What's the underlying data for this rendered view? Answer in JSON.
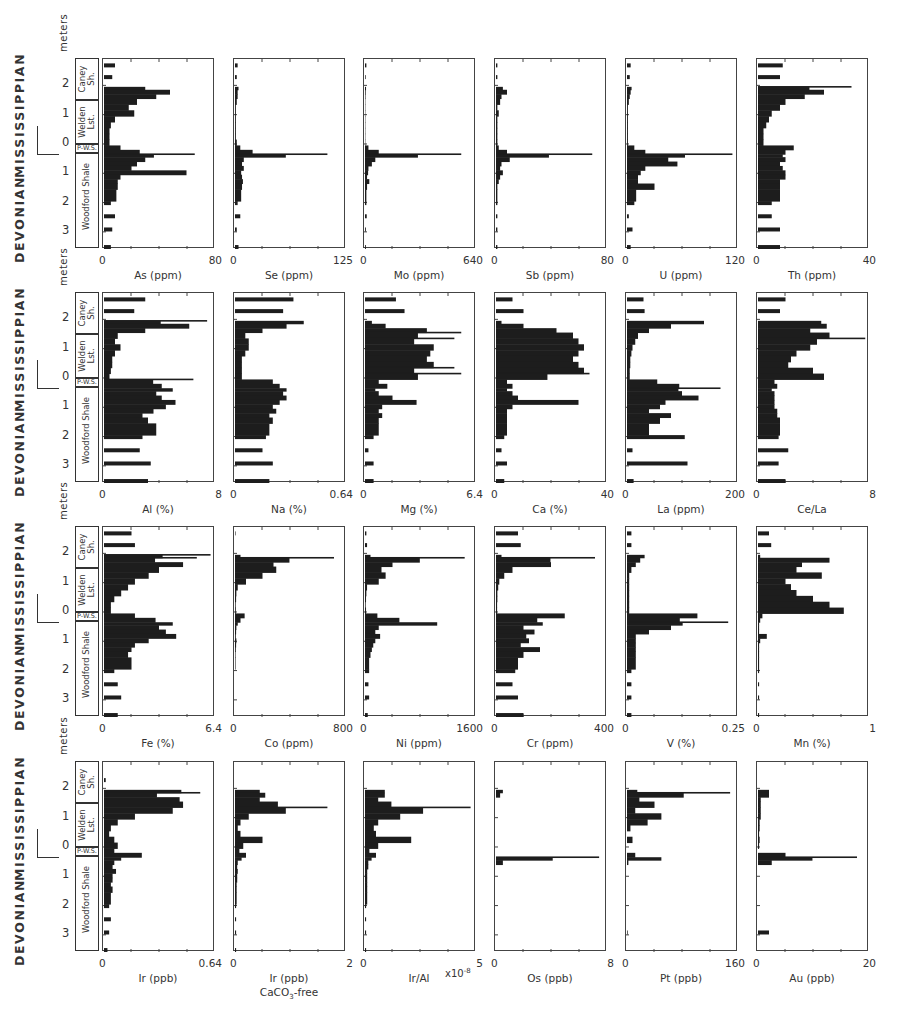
{
  "figure": {
    "stratigraphy": {
      "eras": [
        "MISSISSIPPIAN",
        "DEVONIAN"
      ],
      "depth_axis_label": "meters",
      "depth_ticks": [
        "2",
        "1",
        "0",
        "1",
        "2",
        "3"
      ],
      "units": [
        {
          "name": "Caney Sh.",
          "line1": "Caney",
          "line2": "Sh."
        },
        {
          "name": "Welden Lst.",
          "line1": "Welden",
          "line2": "Lst."
        },
        {
          "name": "P-W.S.",
          "line1": "P-W.S.",
          "line2": ""
        },
        {
          "name": "Woodford Shale",
          "line1": "Woodford Shale",
          "line2": ""
        }
      ],
      "sublabel_mark": "p"
    },
    "rows": [
      {
        "panels": [
          {
            "label": "As (ppm)",
            "min": "0",
            "max": "80"
          },
          {
            "label": "Se (ppm)",
            "min": "0",
            "max": "125"
          },
          {
            "label": "Mo (ppm)",
            "min": "0",
            "max": "640"
          },
          {
            "label": "Sb (ppm)",
            "min": "0",
            "max": "80"
          },
          {
            "label": "U (ppm)",
            "min": "0",
            "max": "120"
          },
          {
            "label": "Th (ppm)",
            "min": "0",
            "max": "40"
          }
        ]
      },
      {
        "panels": [
          {
            "label": "Al (%)",
            "min": "0",
            "max": "8"
          },
          {
            "label": "Na (%)",
            "min": "0",
            "max": "0.64"
          },
          {
            "label": "Mg (%)",
            "min": "0",
            "max": "6.4"
          },
          {
            "label": "Ca (%)",
            "min": "0",
            "max": "40"
          },
          {
            "label": "La (ppm)",
            "min": "0",
            "max": "200"
          },
          {
            "label": "Ce/La",
            "min": "0",
            "max": "8"
          }
        ]
      },
      {
        "panels": [
          {
            "label": "Fe (%)",
            "min": "0",
            "max": "6.4"
          },
          {
            "label": "Co (ppm)",
            "min": "0",
            "max": "800"
          },
          {
            "label": "Ni (ppm)",
            "min": "0",
            "max": "1600"
          },
          {
            "label": "Cr (ppm)",
            "min": "0",
            "max": "400"
          },
          {
            "label": "V (%)",
            "min": "0",
            "max": "0.25"
          },
          {
            "label": "Mn (%)",
            "min": "0",
            "max": "1"
          }
        ]
      },
      {
        "panels": [
          {
            "label": "Ir (ppb)",
            "min": "0",
            "max": "0.64"
          },
          {
            "label": "Ir (ppb)",
            "sub": "CaCO3-free",
            "min": "0",
            "max": "2"
          },
          {
            "label": "Ir/Al",
            "suffix": "x10^-8",
            "min": "0",
            "max": "5"
          },
          {
            "label": "Os (ppb)",
            "min": "0",
            "max": "8"
          },
          {
            "label": "Pt (ppb)",
            "min": "0",
            "max": "160"
          },
          {
            "label": "Au (ppb)",
            "min": "0",
            "max": "20"
          }
        ]
      }
    ]
  },
  "chart_data": {
    "type": "bar",
    "orientation": "horizontal",
    "title": "",
    "ylabel": "meters (depth relative to Devonian-Mississippian boundary; positive up above 0, positive down below 0)",
    "ylim": [
      -2.9,
      3.6
    ],
    "y_ticks": [
      2,
      1,
      0,
      -1,
      -2,
      -3
    ],
    "grid": false,
    "legend": null,
    "units_stratigraphic": [
      {
        "unit": "Caney Sh.",
        "from_m": 2.9,
        "to_m": 1.45
      },
      {
        "unit": "Welden Lst.",
        "from_m": 1.45,
        "to_m": -0.05
      },
      {
        "unit": "P-W.S.",
        "from_m": -0.05,
        "to_m": -0.35
      },
      {
        "unit": "Woodford Shale",
        "from_m": -0.35,
        "to_m": -3.6
      }
    ],
    "depth_samples_m": [
      2.75,
      2.35,
      1.95,
      1.85,
      1.7,
      1.55,
      1.35,
      1.15,
      0.95,
      0.75,
      0.55,
      0.35,
      0.15,
      -0.05,
      -0.2,
      -0.35,
      -0.45,
      -0.6,
      -0.75,
      -0.9,
      -1.05,
      -1.2,
      -1.35,
      -1.55,
      -1.95,
      -2.4,
      -2.85,
      -3.45
    ],
    "panels": [
      {
        "name": "As",
        "unit": "ppm",
        "xlim": [
          0,
          80
        ],
        "values": [
          8,
          6,
          30,
          48,
          38,
          24,
          18,
          22,
          8,
          5,
          4,
          4,
          4,
          12,
          26,
          66,
          30,
          24,
          20,
          60,
          12,
          10,
          10,
          9,
          5,
          8,
          6,
          5
        ]
      },
      {
        "name": "Se",
        "unit": "ppm",
        "xlim": [
          0,
          125
        ],
        "values": [
          3,
          2,
          4,
          3,
          3,
          2,
          1,
          1,
          1,
          1,
          1,
          1,
          2,
          6,
          20,
          105,
          10,
          8,
          10,
          7,
          8,
          9,
          8,
          7,
          3,
          6,
          2,
          4
        ]
      },
      {
        "name": "Mo",
        "unit": "ppm",
        "xlim": [
          0,
          640
        ],
        "values": [
          8,
          4,
          6,
          4,
          3,
          2,
          2,
          2,
          2,
          2,
          2,
          2,
          2,
          20,
          80,
          560,
          60,
          40,
          20,
          18,
          12,
          25,
          12,
          8,
          8,
          10,
          5,
          5
        ]
      },
      {
        "name": "Sb",
        "unit": "ppm",
        "xlim": [
          0,
          80
        ],
        "values": [
          1,
          1,
          5,
          8,
          4,
          3,
          1,
          2,
          1,
          1,
          1,
          1,
          1,
          2,
          8,
          70,
          10,
          4,
          3,
          5,
          3,
          2,
          1,
          1,
          1,
          1,
          1,
          1
        ]
      },
      {
        "name": "U",
        "unit": "ppm",
        "xlim": [
          0,
          120
        ],
        "values": [
          4,
          3,
          5,
          4,
          3,
          2,
          1,
          1,
          1,
          1,
          1,
          1,
          1,
          8,
          20,
          115,
          45,
          55,
          20,
          15,
          12,
          12,
          30,
          10,
          8,
          2,
          6,
          4
        ]
      },
      {
        "name": "Th",
        "unit": "ppm",
        "xlim": [
          0,
          40
        ],
        "values": [
          9,
          8,
          34,
          24,
          17,
          10,
          8,
          5,
          4,
          3,
          2,
          2,
          2,
          13,
          10,
          9,
          10,
          8,
          9,
          10,
          10,
          8,
          8,
          8,
          5,
          5,
          8,
          8
        ]
      },
      {
        "name": "Al",
        "unit": "%",
        "xlim": [
          0,
          8
        ],
        "values": [
          3.0,
          2.2,
          7.5,
          6.2,
          3.0,
          1.0,
          0.8,
          1.2,
          0.8,
          0.6,
          0.6,
          0.5,
          0.4,
          6.5,
          4.2,
          5.0,
          3.8,
          4.2,
          5.2,
          4.5,
          3.6,
          2.8,
          3.2,
          3.8,
          2.8,
          2.6,
          3.4,
          3.2
        ]
      },
      {
        "name": "Na",
        "unit": "%",
        "xlim": [
          0,
          0.64
        ],
        "values": [
          0.34,
          0.28,
          0.4,
          0.3,
          0.16,
          0.06,
          0.08,
          0.08,
          0.06,
          0.04,
          0.04,
          0.04,
          0.04,
          0.22,
          0.26,
          0.3,
          0.28,
          0.3,
          0.26,
          0.22,
          0.24,
          0.2,
          0.22,
          0.2,
          0.18,
          0.16,
          0.22,
          0.2
        ]
      },
      {
        "name": "Mg",
        "unit": "%",
        "xlim": [
          0,
          6.4
        ],
        "values": [
          1.8,
          2.3,
          0.4,
          1.2,
          3.6,
          5.6,
          5.2,
          4.0,
          3.8,
          3.6,
          4.0,
          5.2,
          5.6,
          0.8,
          1.3,
          0.6,
          0.8,
          1.6,
          3.0,
          1.0,
          0.8,
          1.0,
          0.8,
          0.8,
          0.5,
          0.2,
          0.5,
          0.5
        ]
      },
      {
        "name": "Ca",
        "unit": "%",
        "xlim": [
          0,
          40
        ],
        "values": [
          6,
          10,
          2,
          10,
          22,
          28,
          30,
          32,
          30,
          28,
          30,
          32,
          34,
          4,
          6,
          4,
          6,
          8,
          30,
          6,
          4,
          4,
          4,
          4,
          3,
          2,
          4,
          3
        ]
      },
      {
        "name": "La",
        "unit": "ppm",
        "xlim": [
          0,
          200
        ],
        "values": [
          30,
          32,
          140,
          80,
          40,
          20,
          15,
          10,
          8,
          6,
          6,
          5,
          5,
          55,
          95,
          170,
          100,
          130,
          70,
          60,
          40,
          80,
          60,
          40,
          105,
          10,
          110,
          12
        ]
      },
      {
        "name": "Ce/La",
        "unit": "",
        "xlim": [
          0,
          8
        ],
        "values": [
          2.0,
          1.6,
          4.6,
          5.0,
          3.8,
          5.2,
          7.8,
          3.8,
          2.8,
          2.4,
          2.2,
          4.0,
          4.8,
          1.2,
          1.4,
          1.0,
          1.2,
          1.2,
          1.2,
          1.2,
          1.4,
          1.4,
          1.6,
          1.6,
          1.5,
          2.2,
          1.5,
          2.0
        ]
      },
      {
        "name": "Fe",
        "unit": "%",
        "xlim": [
          0,
          6.4
        ],
        "values": [
          1.6,
          1.8,
          6.2,
          5.4,
          4.6,
          3.2,
          2.6,
          1.8,
          1.4,
          1.0,
          0.6,
          0.4,
          0.4,
          1.8,
          3.0,
          4.0,
          3.2,
          3.6,
          4.2,
          2.6,
          1.8,
          1.6,
          1.4,
          1.6,
          0.6,
          0.8,
          1.0,
          0.8
        ]
      },
      {
        "name": "Co",
        "unit": "ppm",
        "xlim": [
          0,
          800
        ],
        "values": [
          4,
          2,
          40,
          720,
          280,
          300,
          200,
          80,
          20,
          10,
          8,
          5,
          6,
          70,
          40,
          20,
          10,
          8,
          6,
          10,
          8,
          6,
          4,
          4,
          2,
          2,
          2,
          2
        ]
      },
      {
        "name": "Ni",
        "unit": "ppm",
        "xlim": [
          0,
          1600
        ],
        "values": [
          20,
          30,
          80,
          1450,
          400,
          240,
          300,
          200,
          30,
          20,
          15,
          10,
          15,
          180,
          500,
          1050,
          200,
          150,
          220,
          150,
          120,
          100,
          80,
          60,
          60,
          50,
          60,
          40
        ]
      },
      {
        "name": "Cr",
        "unit": "ppm",
        "xlim": [
          0,
          400
        ],
        "values": [
          80,
          90,
          20,
          360,
          200,
          60,
          30,
          12,
          8,
          5,
          5,
          4,
          4,
          250,
          150,
          170,
          100,
          140,
          110,
          120,
          90,
          160,
          100,
          80,
          70,
          60,
          80,
          100
        ]
      },
      {
        "name": "V",
        "unit": "%",
        "xlim": [
          0,
          0.25
        ],
        "values": [
          0.01,
          0.01,
          0.04,
          0.03,
          0.02,
          0.01,
          0.005,
          0.005,
          0.005,
          0.005,
          0.005,
          0.005,
          0.005,
          0.16,
          0.12,
          0.23,
          0.1,
          0.05,
          0.02,
          0.02,
          0.02,
          0.02,
          0.02,
          0.02,
          0.01,
          0.01,
          0.01,
          0.01
        ]
      },
      {
        "name": "Mn",
        "unit": "%",
        "xlim": [
          0,
          1
        ],
        "values": [
          0.1,
          0.12,
          0.02,
          0.65,
          0.4,
          0.35,
          0.58,
          0.25,
          0.3,
          0.35,
          0.5,
          0.65,
          0.78,
          0.04,
          0.02,
          0.01,
          0.01,
          0.01,
          0.08,
          0.02,
          0.01,
          0.01,
          0.01,
          0.01,
          0.01,
          0.01,
          0.01,
          0.01
        ]
      },
      {
        "name": "Ir",
        "unit": "ppb",
        "xlim": [
          0,
          0.64
        ],
        "values": [
          0.0,
          0.01,
          0.45,
          0.56,
          0.44,
          0.46,
          0.4,
          0.18,
          0.08,
          0.04,
          0.03,
          0.06,
          0.08,
          0.06,
          0.22,
          0.1,
          0.06,
          0.05,
          0.07,
          0.05,
          0.05,
          0.04,
          0.05,
          0.04,
          0.03,
          0.04,
          0.03,
          0.02
        ]
      },
      {
        "name": "Ir (CaCO3-free)",
        "unit": "ppb",
        "xlim": [
          0,
          2
        ],
        "values": [
          0.0,
          0.0,
          0.45,
          0.55,
          0.45,
          0.78,
          1.68,
          0.25,
          0.1,
          0.05,
          0.1,
          0.5,
          0.15,
          0.08,
          0.2,
          0.12,
          0.05,
          0.04,
          0.05,
          0.04,
          0.04,
          0.03,
          0.03,
          0.03,
          0.02,
          0.02,
          0.02,
          0.02
        ]
      },
      {
        "name": "Ir/Al",
        "unit": "x10^-8",
        "xlim": [
          0,
          5
        ],
        "values": [
          0.0,
          0.0,
          0.9,
          0.9,
          0.6,
          1.2,
          4.8,
          1.6,
          0.6,
          0.4,
          0.5,
          2.1,
          0.6,
          0.2,
          0.5,
          0.3,
          0.15,
          0.15,
          0.1,
          0.1,
          0.1,
          0.1,
          0.1,
          0.1,
          0.05,
          0.05,
          0.05,
          0.05
        ]
      },
      {
        "name": "Os",
        "unit": "ppb",
        "xlim": [
          0,
          8
        ],
        "values": [
          0,
          0,
          0.5,
          0.3,
          0,
          0,
          0,
          0,
          0,
          0,
          0,
          0,
          0,
          0,
          0,
          7.5,
          0.5,
          0,
          0,
          0,
          0,
          0,
          0,
          0,
          0,
          0,
          0,
          0
        ]
      },
      {
        "name": "Pt",
        "unit": "ppb",
        "xlim": [
          0,
          160
        ],
        "values": [
          0,
          0,
          15,
          150,
          18,
          40,
          12,
          50,
          30,
          5,
          0,
          8,
          0,
          0,
          12,
          50,
          2,
          0,
          0,
          0,
          0,
          0,
          0,
          0,
          0,
          0,
          1,
          0
        ]
      },
      {
        "name": "Au",
        "unit": "ppb",
        "xlim": [
          0,
          20
        ],
        "values": [
          0,
          0,
          2,
          2,
          0.5,
          0.5,
          0.5,
          0.5,
          0.3,
          0.3,
          0.2,
          0.3,
          0.2,
          0,
          5,
          18,
          2.5,
          0,
          0,
          0,
          0,
          0,
          0,
          0,
          0,
          0,
          2,
          0
        ]
      }
    ]
  }
}
